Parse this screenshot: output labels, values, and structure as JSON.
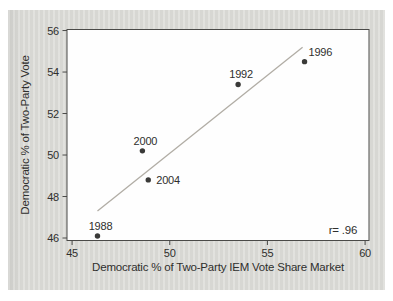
{
  "figure": {
    "page_bg": "#ffffff",
    "panel_bg": "#dcdcd8",
    "plot_bg": "#fefefe",
    "axis_color": "#4a4a48",
    "text_color": "#2f2f2d",
    "point_color": "#3a3a38",
    "fit_line_color": "#b1ada5"
  },
  "chart_data": {
    "type": "scatter",
    "title": "",
    "xlabel": "Democratic % of Two-Party IEM Vote Share Market",
    "ylabel": "Democratic % of Two-Party Vote",
    "xlim": [
      44.74,
      60.2
    ],
    "ylim": [
      45.88,
      56.05
    ],
    "xticks": [
      45,
      50,
      55,
      60
    ],
    "yticks": [
      46,
      48,
      50,
      52,
      54,
      56
    ],
    "grid": false,
    "legend": null,
    "points": [
      {
        "label": "1988",
        "x": 46.3,
        "y": 46.1,
        "label_pos": "above"
      },
      {
        "label": "2000",
        "x": 48.6,
        "y": 50.2,
        "label_pos": "above"
      },
      {
        "label": "2004",
        "x": 48.9,
        "y": 48.8,
        "label_pos": "right"
      },
      {
        "label": "1992",
        "x": 53.5,
        "y": 53.4,
        "label_pos": "above"
      },
      {
        "label": "1996",
        "x": 56.9,
        "y": 54.5,
        "label_pos": "above-right"
      }
    ],
    "fit_line": {
      "x1": 46.3,
      "y1": 47.3,
      "x2": 56.8,
      "y2": 55.2
    },
    "annotation": {
      "text": "r= .96",
      "x": 59.6,
      "y": 46.4,
      "align": "end"
    }
  }
}
